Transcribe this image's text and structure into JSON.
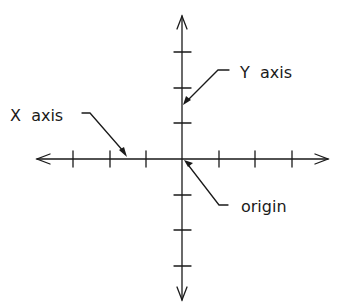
{
  "diagram": {
    "type": "coordinate-plane",
    "labels": {
      "y_axis": "Y  axis",
      "x_axis": "X  axis",
      "origin": "origin"
    },
    "origin_px": [
      182,
      159
    ],
    "tick_spacing_px": 36.5,
    "x_ticks": [
      -3,
      -2,
      -1,
      1,
      2,
      3
    ],
    "y_ticks": [
      3,
      2,
      1,
      -1,
      -2,
      -3
    ],
    "colors": {
      "ink": "#1a1a1a",
      "background": "#ffffff"
    }
  }
}
